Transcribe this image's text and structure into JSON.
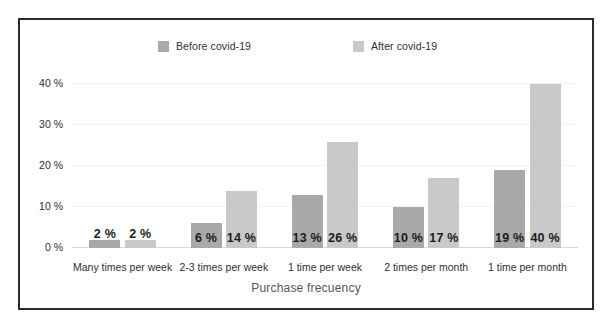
{
  "chart_data": {
    "type": "bar",
    "title": "",
    "subtitle": "",
    "xlabel": "Purchase frecuency",
    "ylabel": "",
    "grid": true,
    "legend_position": "top",
    "categories": [
      "Many times per week",
      "2-3 times per week",
      "1 time per week",
      "2 times per month",
      "1 time per month"
    ],
    "series": [
      {
        "name": "Before covid-19",
        "color": "#a9a9a9",
        "values": [
          2,
          6,
          13,
          10,
          19
        ],
        "value_labels": [
          "2 %",
          "6 %",
          "13 %",
          "10 %",
          "19 %"
        ]
      },
      {
        "name": "After covid-19",
        "color": "#c9c9c9",
        "values": [
          2,
          14,
          26,
          17,
          40
        ],
        "value_labels": [
          "2 %",
          "14 %",
          "26 %",
          "17 %",
          "40 %"
        ]
      }
    ],
    "ylim": [
      0,
      44
    ],
    "yticks": [
      0,
      10,
      20,
      30,
      40
    ],
    "ytick_labels": [
      "0 %",
      "10 %",
      "20 %",
      "30 %",
      "40 %"
    ]
  },
  "legend": {
    "items": [
      {
        "label": "Before covid-19",
        "color": "#a9a9a9"
      },
      {
        "label": "After covid-19",
        "color": "#c9c9c9"
      }
    ]
  },
  "axis": {
    "x_title": "Purchase frecuency"
  },
  "style": {
    "frame_color": "#2b2b2e",
    "background": "#ffffff",
    "grid_color": "#f3f3f3",
    "baseline_color": "#d9d9d9",
    "text_color": "#2f2f33",
    "value_text_color": "#1c1c1f"
  }
}
